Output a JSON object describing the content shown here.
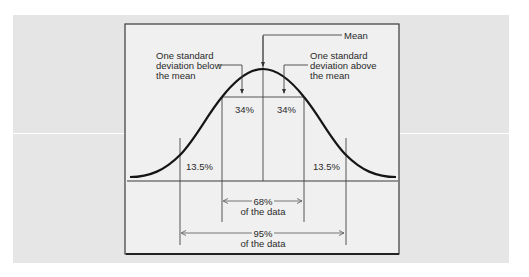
{
  "diagram": {
    "labels": {
      "mean": "Mean",
      "below_line1": "One standard",
      "below_line2": "deviation below",
      "below_line3": "the mean",
      "above_line1": "One standard",
      "above_line2": "deviation above",
      "above_line3": "the mean",
      "pct_inner_left": "34%",
      "pct_inner_right": "34%",
      "pct_outer_left": "13.5%",
      "pct_outer_right": "13.5%",
      "range_68": "68%",
      "range_68_sub": "of the data",
      "range_95": "95%",
      "range_95_sub": "of the data"
    },
    "colors": {
      "panel": "#e5e5e5",
      "box": "#f0f0f0",
      "curve": "#1a1a1a",
      "line": "#3a3a3a"
    }
  }
}
